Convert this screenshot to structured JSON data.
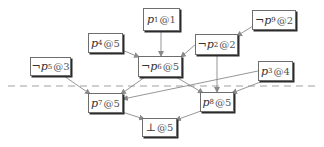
{
  "diagram": {
    "type": "implication-graph",
    "colors": {
      "edge": "#8a8a8a",
      "border": "#6e6e6e",
      "shadow": "#2a2a2a",
      "text": "#333333",
      "cut_line": "#a0a0a0"
    },
    "nodes": [
      {
        "id": "p1",
        "neg": "",
        "var": "p",
        "sub": "1",
        "at": "@",
        "level": "1",
        "label": "p1@1",
        "x": 143,
        "y": 8,
        "w": 37,
        "h": 23
      },
      {
        "id": "p9",
        "neg": "¬",
        "var": "p",
        "sub": "9",
        "at": "@",
        "level": "2",
        "label": "¬p9@2",
        "x": 252,
        "y": 10,
        "w": 44,
        "h": 20
      },
      {
        "id": "p4",
        "neg": "",
        "var": "p",
        "sub": "4",
        "at": "@",
        "level": "5",
        "label": "p4@5",
        "x": 88,
        "y": 33,
        "w": 35,
        "h": 20
      },
      {
        "id": "p2",
        "neg": "¬",
        "var": "p",
        "sub": "2",
        "at": "@",
        "level": "2",
        "label": "¬p2@2",
        "x": 195,
        "y": 34,
        "w": 43,
        "h": 21
      },
      {
        "id": "p6",
        "neg": "¬",
        "var": "p",
        "sub": "6",
        "at": "@",
        "level": "5",
        "label": "¬p6@5",
        "x": 138,
        "y": 56,
        "w": 44,
        "h": 21
      },
      {
        "id": "p5",
        "neg": "¬",
        "var": "p",
        "sub": "5",
        "at": "@",
        "level": "3",
        "label": "¬p5@3",
        "x": 30,
        "y": 57,
        "w": 41,
        "h": 19
      },
      {
        "id": "p3",
        "neg": "",
        "var": "p",
        "sub": "3",
        "at": "@",
        "level": "4",
        "label": "p3@4",
        "x": 258,
        "y": 61,
        "w": 35,
        "h": 20
      },
      {
        "id": "p7",
        "neg": "",
        "var": "p",
        "sub": "7",
        "at": "@",
        "level": "5",
        "label": "p7@5",
        "x": 88,
        "y": 93,
        "w": 35,
        "h": 20
      },
      {
        "id": "p8",
        "neg": "",
        "var": "p",
        "sub": "8",
        "at": "@",
        "level": "5",
        "label": "p8@5",
        "x": 200,
        "y": 92,
        "w": 34,
        "h": 20
      },
      {
        "id": "bot",
        "neg": "",
        "var": "⊥",
        "sub": "",
        "at": "@",
        "level": "5",
        "label": "⊥@5",
        "x": 142,
        "y": 118,
        "w": 35,
        "h": 19
      }
    ],
    "edges": [
      {
        "from": "p1",
        "to": "p6",
        "x1": 161,
        "y1": 31,
        "x2": 161,
        "y2": 56
      },
      {
        "from": "p4",
        "to": "p6",
        "x1": 122,
        "y1": 50,
        "x2": 139,
        "y2": 57
      },
      {
        "from": "p2",
        "to": "p6",
        "x1": 196,
        "y1": 44,
        "x2": 181,
        "y2": 57
      },
      {
        "from": "p9",
        "to": "p2",
        "x1": 253,
        "y1": 26,
        "x2": 237,
        "y2": 36
      },
      {
        "from": "p5",
        "to": "p7",
        "x1": 64,
        "y1": 76,
        "x2": 90,
        "y2": 94
      },
      {
        "from": "p6",
        "to": "p7",
        "x1": 145,
        "y1": 77,
        "x2": 121,
        "y2": 94
      },
      {
        "from": "p3",
        "to": "p7",
        "x1": 258,
        "y1": 71,
        "x2": 123,
        "y2": 99
      },
      {
        "from": "p6",
        "to": "p8",
        "x1": 176,
        "y1": 77,
        "x2": 203,
        "y2": 93
      },
      {
        "from": "p2",
        "to": "p8",
        "x1": 217,
        "y1": 55,
        "x2": 217,
        "y2": 92
      },
      {
        "from": "p3",
        "to": "p8",
        "x1": 263,
        "y1": 81,
        "x2": 232,
        "y2": 93
      },
      {
        "from": "p7",
        "to": "bot",
        "x1": 122,
        "y1": 112,
        "x2": 144,
        "y2": 119
      },
      {
        "from": "p8",
        "to": "bot",
        "x1": 201,
        "y1": 111,
        "x2": 176,
        "y2": 120
      }
    ],
    "cut_line": {
      "style": "dashed",
      "x1": 8,
      "y1": 86,
      "x2": 318,
      "y2": 86
    }
  }
}
